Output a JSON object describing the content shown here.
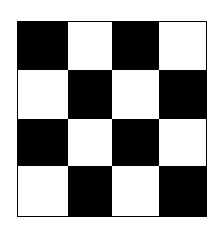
{
  "board": {
    "rows": 4,
    "cols": 4,
    "colors": {
      "dark": "#000000",
      "light": "#ffffff"
    },
    "cells": [
      [
        "dark",
        "light",
        "dark",
        "light"
      ],
      [
        "light",
        "dark",
        "light",
        "dark"
      ],
      [
        "dark",
        "light",
        "dark",
        "light"
      ],
      [
        "light",
        "dark",
        "light",
        "dark"
      ]
    ]
  }
}
